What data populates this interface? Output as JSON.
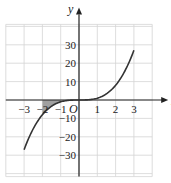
{
  "chart_data": {
    "type": "line",
    "title": "",
    "function": "y = x^3",
    "xlabel": "x",
    "ylabel": "y",
    "origin_label": "O",
    "xlim": [
      -4,
      4
    ],
    "ylim": [
      -40,
      40
    ],
    "grid": true,
    "x_ticks": [
      -3,
      -2,
      -1,
      1,
      2,
      3
    ],
    "x_tick_labels": [
      "−3",
      "−2",
      "−1",
      "1",
      "2",
      "3"
    ],
    "y_ticks": [
      30,
      20,
      10,
      -10,
      -20,
      -30
    ],
    "y_tick_labels": [
      "30",
      "20",
      "10",
      "−10",
      "−20",
      "−30"
    ],
    "series": [
      {
        "name": "y = x^3",
        "x": [
          -3,
          -2.5,
          -2,
          -1.5,
          -1,
          -0.5,
          0,
          0.5,
          1,
          1.5,
          2,
          2.5,
          3
        ],
        "y": [
          -27,
          -15.625,
          -8,
          -3.375,
          -1,
          -0.125,
          0,
          0.125,
          1,
          3.375,
          8,
          15.625,
          27
        ],
        "color": "#333333"
      }
    ],
    "shaded_region": {
      "description": "Area between curve y = x^3 and x-axis from x = -2 to x = -1",
      "x_from": -2,
      "x_to": -1,
      "color": "#a0a0a0"
    },
    "colors": {
      "grid": "#d4d4d4",
      "axis": "#222222",
      "curve": "#333333",
      "shade": "#a0a0a0"
    }
  }
}
